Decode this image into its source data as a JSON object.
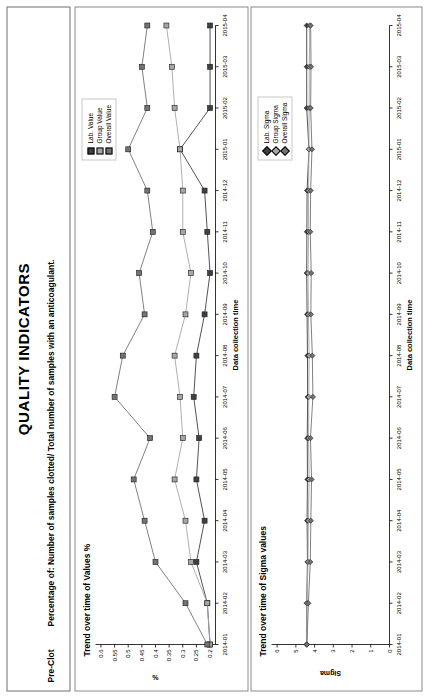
{
  "header": {
    "title": "QUALITY INDICATORS",
    "indicator_key": "Pre-Clot",
    "description": "Percentage of: Number of samples clotted/ Total number of samples with an anticoagulant."
  },
  "colors": {
    "lab": "#404040",
    "group": "#a6a6a6",
    "overall": "#737373",
    "axis": "#000000",
    "panel_border": "#8a8a8a"
  },
  "charts": [
    {
      "id": "values-chart",
      "title": "Trend over time of Values %",
      "xlabel": "Data collection time",
      "ylabel": "%",
      "legend": [
        "Lab. Value",
        "Group Value",
        "Overall Value"
      ]
    },
    {
      "id": "sigma-chart",
      "title": "Trend over time of Sigma values",
      "xlabel": "Data collection time",
      "ylabel": "Sigma",
      "legend": [
        "Lab. Sigma",
        "Group Sigma",
        "Overall Sigma"
      ]
    }
  ],
  "chart_data": [
    {
      "type": "line",
      "title": "Trend over time of Values %",
      "xlabel": "Data collection time",
      "ylabel": "%",
      "x": [
        "2014-01",
        "2014-02",
        "2014-03",
        "2014-04",
        "2014-05",
        "2014-06",
        "2014-07",
        "2014-08",
        "2014-09",
        "2014-10",
        "2014-11",
        "2014-12",
        "2015-01",
        "2015-02",
        "2015-03",
        "2015-04"
      ],
      "xticklabels": [
        "2014-01",
        "2014-02",
        "2014-03",
        "2014-04",
        "2014-05",
        "2014-06",
        "2014-07",
        "2014-08",
        "2014-09",
        "2014-10",
        "2014-11",
        "2014-12",
        "2015-01",
        "2015-02",
        "2015-03",
        "2015-04"
      ],
      "yticks": [
        0.2,
        0.25,
        0.3,
        0.35,
        0.4,
        0.45,
        0.5,
        0.55,
        0.6
      ],
      "ylim": [
        0.18,
        0.62
      ],
      "grid": false,
      "legend_position": "top-right",
      "series": [
        {
          "name": "Lab. Value",
          "color": "#404040",
          "marker": "square",
          "values": [
            0.2,
            0.21,
            0.25,
            0.22,
            0.25,
            0.24,
            0.26,
            0.25,
            0.22,
            0.2,
            0.21,
            0.22,
            0.31,
            0.2,
            0.2,
            0.2
          ]
        },
        {
          "name": "Group Value",
          "color": "#a6a6a6",
          "marker": "square",
          "values": [
            0.2,
            0.21,
            0.27,
            0.29,
            0.33,
            0.3,
            0.31,
            0.33,
            0.29,
            0.27,
            0.3,
            0.3,
            0.31,
            0.33,
            0.34,
            0.36
          ]
        },
        {
          "name": "Overall Value",
          "color": "#737373",
          "marker": "square",
          "values": [
            0.21,
            0.29,
            0.4,
            0.44,
            0.48,
            0.42,
            0.55,
            0.52,
            0.44,
            0.46,
            0.41,
            0.43,
            0.5,
            0.43,
            0.45,
            0.43
          ]
        }
      ]
    },
    {
      "type": "line",
      "title": "Trend over time of Sigma values",
      "xlabel": "Data collection time",
      "ylabel": "Sigma",
      "x": [
        "2014-01",
        "2014-02",
        "2014-03",
        "2014-04",
        "2014-05",
        "2014-06",
        "2014-07",
        "2014-08",
        "2014-09",
        "2014-10",
        "2014-11",
        "2014-12",
        "2015-01",
        "2015-02",
        "2015-03",
        "2015-04"
      ],
      "xticklabels": [
        "2014-01",
        "2014-02",
        "2014-03",
        "2014-04",
        "2014-05",
        "2014-06",
        "2014-07",
        "2014-08",
        "2014-09",
        "2014-10",
        "2014-11",
        "2014-12",
        "2015-01",
        "2015-02",
        "2015-03",
        "2015-04"
      ],
      "yticks": [
        0,
        1,
        2,
        3,
        4,
        5,
        6
      ],
      "ylim": [
        0,
        6.3
      ],
      "grid": false,
      "legend_position": "top-right",
      "series": [
        {
          "name": "Lab. Sigma",
          "color": "#404040",
          "marker": "diamond",
          "values": [
            4.42,
            4.42,
            4.38,
            4.4,
            4.38,
            4.39,
            4.37,
            4.38,
            4.4,
            4.42,
            4.41,
            4.4,
            4.3,
            4.42,
            4.42,
            4.42
          ]
        },
        {
          "name": "Group Sigma",
          "color": "#a6a6a6",
          "marker": "diamond",
          "values": [
            4.42,
            4.41,
            4.35,
            4.33,
            4.29,
            4.32,
            4.31,
            4.29,
            4.33,
            4.35,
            4.32,
            4.32,
            4.3,
            4.29,
            4.28,
            4.26
          ]
        },
        {
          "name": "Overall Sigma",
          "color": "#737373",
          "marker": "diamond",
          "values": [
            4.41,
            4.33,
            4.23,
            4.2,
            4.16,
            4.22,
            4.09,
            4.12,
            4.2,
            4.18,
            4.23,
            4.21,
            4.14,
            4.21,
            4.19,
            4.21
          ]
        }
      ]
    }
  ]
}
